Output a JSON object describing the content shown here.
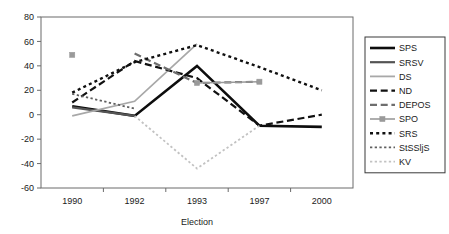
{
  "chart_data": {
    "type": "line",
    "title": "",
    "xlabel": "Election",
    "ylabel": "",
    "categories": [
      "1990",
      "1992",
      "1993",
      "1997",
      "2000"
    ],
    "x": [
      1990,
      1992,
      1993,
      1997,
      2000
    ],
    "ylim": [
      -60,
      80
    ],
    "yticks": [
      -60,
      -40,
      -20,
      0,
      20,
      40,
      60,
      80
    ],
    "ytick_labels": [
      "-60",
      "-40",
      "-20",
      "0",
      "20",
      "40",
      "60",
      "80"
    ],
    "grid": false,
    "legend_position": "right",
    "series": [
      {
        "name": "SPS",
        "values": [
          7,
          -1,
          40,
          -9,
          -10
        ],
        "color": "#0d0d0d",
        "style": "solid",
        "width": 2.6,
        "marker": "none"
      },
      {
        "name": "SRSV",
        "values": [
          6,
          -1,
          null,
          null,
          null
        ],
        "color": "#545454",
        "style": "solid",
        "width": 2.2,
        "marker": "none"
      },
      {
        "name": "DS",
        "values": [
          -1,
          11,
          58,
          null,
          null
        ],
        "color": "#a8a8a8",
        "style": "solid",
        "width": 1.8,
        "marker": "none"
      },
      {
        "name": "ND",
        "values": [
          10,
          44,
          30,
          -9,
          0
        ],
        "color": "#111111",
        "style": "dashed-long",
        "width": 2.2,
        "marker": "none"
      },
      {
        "name": "DEPOS",
        "values": [
          null,
          50,
          26,
          27,
          null
        ],
        "color": "#6e6e6e",
        "style": "dashed-long",
        "width": 2.2,
        "marker": "none"
      },
      {
        "name": "SPO",
        "values": [
          49,
          null,
          26,
          27,
          null
        ],
        "color": "#9a9a9a",
        "style": "solid",
        "width": 1.6,
        "marker": "square"
      },
      {
        "name": "SRS",
        "values": [
          18,
          43,
          57,
          39,
          20
        ],
        "color": "#101010",
        "style": "dotted-sq",
        "width": 2.4,
        "marker": "none"
      },
      {
        "name": "StSSljS",
        "values": [
          17,
          5,
          null,
          null,
          null
        ],
        "color": "#5f5f5f",
        "style": "dotted-sq",
        "width": 1.8,
        "marker": "none"
      },
      {
        "name": "KV",
        "values": [
          null,
          -1,
          -44,
          -9,
          null
        ],
        "color": "#c2c2c2",
        "style": "dotted-sq",
        "width": 1.8,
        "marker": "none"
      }
    ]
  },
  "legend": {
    "entries": [
      {
        "label": "SPS"
      },
      {
        "label": "SRSV"
      },
      {
        "label": "DS"
      },
      {
        "label": "ND"
      },
      {
        "label": "DEPOS"
      },
      {
        "label": "SPO"
      },
      {
        "label": "SRS"
      },
      {
        "label": "StSSljS"
      },
      {
        "label": "KV"
      }
    ]
  },
  "axes": {
    "x_title": "Election",
    "x_tick_labels": [
      "1990",
      "1992",
      "1993",
      "1997",
      "2000"
    ],
    "y_tick_labels": [
      "80",
      "60",
      "40",
      "20",
      "0",
      "-20",
      "-40",
      "-60"
    ]
  },
  "colors": {
    "frame": "#6b6b6b",
    "text": "#1a1a1a",
    "legend_border": "#3a3a3a",
    "background": "#ffffff"
  }
}
